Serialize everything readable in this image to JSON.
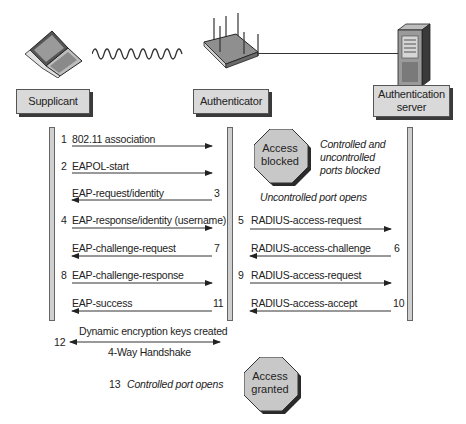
{
  "entities": {
    "supplicant": {
      "label": "Supplicant",
      "icon": "laptop-icon"
    },
    "authenticator": {
      "label": "Authenticator",
      "icon": "wireless-access-point-icon"
    },
    "server": {
      "label_line1": "Authentication",
      "label_line2": "server",
      "icon": "server-tower-icon"
    }
  },
  "links": {
    "wireless": "wireless-wave-icon",
    "wired": "wired-connection-line"
  },
  "steps": [
    {
      "num": "1",
      "label": "802.11 association",
      "from": "supplicant",
      "to": "authenticator"
    },
    {
      "num": "2",
      "label": "EAPOL-start",
      "from": "supplicant",
      "to": "authenticator"
    },
    {
      "num": "3",
      "label": "EAP-request/identity",
      "from": "authenticator",
      "to": "supplicant"
    },
    {
      "num": "4",
      "label": "EAP-response/identity (username)",
      "from": "supplicant",
      "to": "authenticator"
    },
    {
      "num": "5",
      "label": "RADIUS-access-request",
      "from": "authenticator",
      "to": "server"
    },
    {
      "num": "6",
      "label": "RADIUS-access-challenge",
      "from": "server",
      "to": "authenticator"
    },
    {
      "num": "7",
      "label": "EAP-challenge-request",
      "from": "authenticator",
      "to": "supplicant"
    },
    {
      "num": "8",
      "label": "EAP-challenge-response",
      "from": "supplicant",
      "to": "authenticator"
    },
    {
      "num": "9",
      "label": "RADIUS-access-request",
      "from": "authenticator",
      "to": "server"
    },
    {
      "num": "10",
      "label": "RADIUS-access-accept",
      "from": "server",
      "to": "authenticator"
    },
    {
      "num": "11",
      "label": "EAP-success",
      "from": "authenticator",
      "to": "supplicant"
    },
    {
      "num": "12",
      "label_top": "Dynamic encryption keys created",
      "label_bottom": "4-Way Handshake",
      "from": "supplicant",
      "to": "authenticator",
      "bidirectional": true
    },
    {
      "num": "13",
      "label": "Controlled port opens"
    }
  ],
  "notes": {
    "ports_blocked_line1": "Controlled and",
    "ports_blocked_line2": "uncontrolled",
    "ports_blocked_line3": "ports blocked",
    "uncontrolled_opens": "Uncontrolled port opens"
  },
  "states": {
    "blocked_line1": "Access",
    "blocked_line2": "blocked",
    "granted_line1": "Access",
    "granted_line2": "granted"
  },
  "colors": {
    "box_fill": "#d9d9d9",
    "lifeline_fill": "#cfcfcf",
    "octagon_fill": "#c8c8c8",
    "line": "#222222"
  }
}
